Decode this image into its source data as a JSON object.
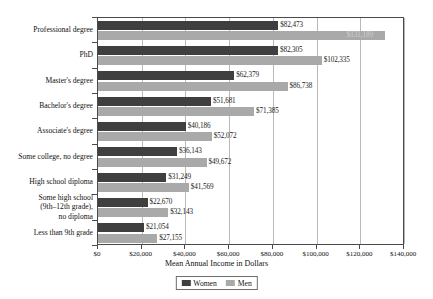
{
  "chart_data": {
    "type": "bar",
    "orientation": "horizontal",
    "title": "",
    "xlabel": "Mean Annual Income in Dollars",
    "ylabel": "",
    "xlim": [
      0,
      140000
    ],
    "xticks": [
      0,
      20000,
      40000,
      60000,
      80000,
      100000,
      120000,
      140000
    ],
    "xtick_labels": [
      "$0",
      "$20,000",
      "$40,000",
      "$60,000",
      "$80,000",
      "$100,000",
      "$120,000",
      "$140,000"
    ],
    "grid": true,
    "legend_position": "bottom-center",
    "categories": [
      "Professional degree",
      "PhD",
      "Master's degree",
      "Bachelor's degree",
      "Associate's degree",
      "Some college, no degree",
      "High school diploma",
      "Some high school\n(9th–12th grade),\nno diploma",
      "Less than 9th grade"
    ],
    "series": [
      {
        "name": "Women",
        "color": "#3f3f3f",
        "values": [
          82473,
          82305,
          62379,
          51681,
          40186,
          36143,
          31249,
          22670,
          21054
        ],
        "labels": [
          "$82,473",
          "$82,305",
          "$62,379",
          "$51,681",
          "$40,186",
          "$36,143",
          "$31,249",
          "$22,670",
          "$21,054"
        ]
      },
      {
        "name": "Men",
        "color": "#a9a9a9",
        "values": [
          131189,
          102335,
          86738,
          71385,
          52072,
          49672,
          41569,
          32143,
          27155
        ],
        "labels": [
          "$131,189",
          "$102,335",
          "$86,738",
          "$71,385",
          "$52,072",
          "$49,672",
          "$41,569",
          "$32,143",
          "$27,155"
        ]
      }
    ]
  },
  "legend": {
    "items": [
      {
        "label": "Women",
        "color": "#3f3f3f"
      },
      {
        "label": "Men",
        "color": "#a9a9a9"
      }
    ]
  }
}
